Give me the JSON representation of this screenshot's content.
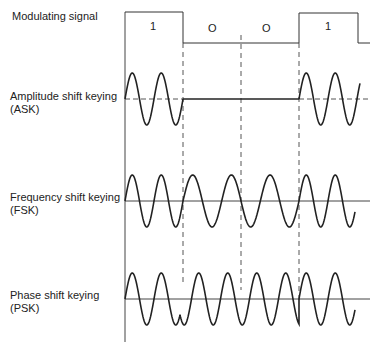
{
  "labels": {
    "modulating": "Modulating signal",
    "ask_line1": "Amplitude shift keying",
    "ask_line2": "(ASK)",
    "fsk_line1": "Frequency shift keying",
    "fsk_line2": "(FSK)",
    "psk_line1": "Phase shift keying",
    "psk_line2": "(PSK)"
  },
  "bits": [
    "1",
    "O",
    "O",
    "1"
  ],
  "colors": {
    "stroke": "#222222",
    "dash": "#555555"
  }
}
